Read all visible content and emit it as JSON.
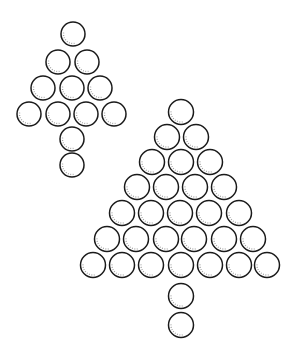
{
  "figure": {
    "width": 295,
    "height": 357,
    "stroke_color": "#1a1a1a",
    "shade_color": "#9a9a9a",
    "background": "#ffffff"
  },
  "trees": [
    {
      "name": "small-tree",
      "radius": 12,
      "rows": [
        {
          "y": 34,
          "x": [
            73
          ]
        },
        {
          "y": 62,
          "x": [
            58,
            87
          ]
        },
        {
          "y": 88,
          "x": [
            43,
            72,
            100
          ]
        },
        {
          "y": 114,
          "x": [
            29,
            58,
            86,
            114
          ]
        }
      ],
      "trunk": [
        {
          "x": 72,
          "y": 139
        },
        {
          "x": 72,
          "y": 165
        }
      ]
    },
    {
      "name": "large-tree",
      "radius": 12.5,
      "rows": [
        {
          "y": 112,
          "x": [
            181
          ]
        },
        {
          "y": 137,
          "x": [
            167,
            196
          ]
        },
        {
          "y": 162,
          "x": [
            152,
            181,
            210
          ]
        },
        {
          "y": 187,
          "x": [
            137,
            166,
            195,
            224
          ]
        },
        {
          "y": 213,
          "x": [
            122,
            151,
            180,
            209,
            239
          ]
        },
        {
          "y": 239,
          "x": [
            107,
            136,
            166,
            194,
            224,
            253
          ]
        },
        {
          "y": 265,
          "x": [
            93,
            122,
            151,
            181,
            210,
            239,
            267
          ]
        }
      ],
      "trunk": [
        {
          "x": 181,
          "y": 296
        },
        {
          "x": 181,
          "y": 325
        }
      ]
    }
  ]
}
